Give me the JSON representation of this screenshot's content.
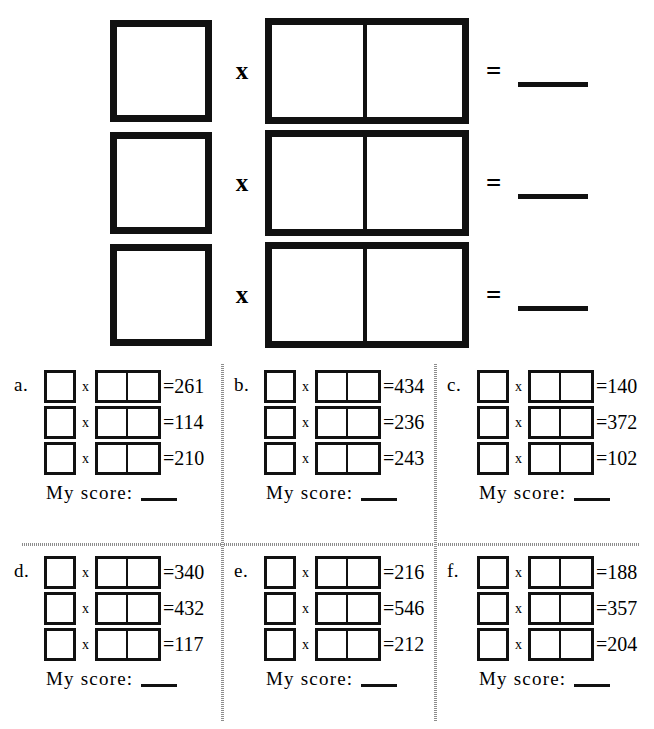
{
  "worksheet": {
    "symbols": {
      "times": "x",
      "equals": "=",
      "equals_prefix": "="
    },
    "top_section": {
      "rows": [
        {
          "times": "x",
          "equals": "=",
          "answer": ""
        },
        {
          "times": "x",
          "equals": "=",
          "answer": ""
        },
        {
          "times": "x",
          "equals": "=",
          "answer": ""
        }
      ]
    },
    "panels": [
      {
        "letter": "a.",
        "score_label": "My score:",
        "score_value": "",
        "problems": [
          {
            "times": "x",
            "result": "=261"
          },
          {
            "times": "x",
            "result": "=114"
          },
          {
            "times": "x",
            "result": "=210"
          }
        ]
      },
      {
        "letter": "b.",
        "score_label": "My score:",
        "score_value": "",
        "problems": [
          {
            "times": "x",
            "result": "=434"
          },
          {
            "times": "x",
            "result": "=236"
          },
          {
            "times": "x",
            "result": "=243"
          }
        ]
      },
      {
        "letter": "c.",
        "score_label": "My score:",
        "score_value": "",
        "problems": [
          {
            "times": "x",
            "result": "=140"
          },
          {
            "times": "x",
            "result": "=372"
          },
          {
            "times": "x",
            "result": "=102"
          }
        ]
      },
      {
        "letter": "d.",
        "score_label": "My score:",
        "score_value": "",
        "problems": [
          {
            "times": "x",
            "result": "=340"
          },
          {
            "times": "x",
            "result": "=432"
          },
          {
            "times": "x",
            "result": "=117"
          }
        ]
      },
      {
        "letter": "e.",
        "score_label": "My score:",
        "score_value": "",
        "problems": [
          {
            "times": "x",
            "result": "=216"
          },
          {
            "times": "x",
            "result": "=546"
          },
          {
            "times": "x",
            "result": "=212"
          }
        ]
      },
      {
        "letter": "f.",
        "score_label": "My score:",
        "score_value": "",
        "problems": [
          {
            "times": "x",
            "result": "=188"
          },
          {
            "times": "x",
            "result": "=357"
          },
          {
            "times": "x",
            "result": "=204"
          }
        ]
      }
    ],
    "colors": {
      "ink": "#111111",
      "paper": "#ffffff",
      "divider": "#8d8d8d"
    }
  }
}
